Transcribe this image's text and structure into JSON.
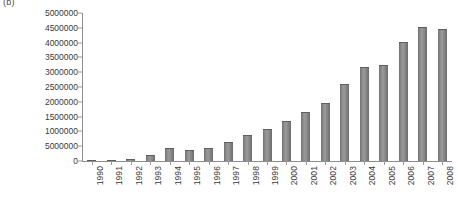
{
  "figure": {
    "panel_label": "(b)",
    "bar_color": "#7d7d7d",
    "axis_color": "#8d8d8d",
    "text_color": "#3a3a3a",
    "background": "#ffffff"
  },
  "chart_data": {
    "type": "bar",
    "title": "",
    "subtitle": "",
    "xlabel": "",
    "ylabel": "",
    "categories": [
      "1990",
      "1991",
      "1992",
      "1993",
      "1994",
      "1995",
      "1996",
      "1997",
      "1998",
      "1999",
      "2000",
      "2001",
      "2002",
      "2003",
      "2004",
      "2005",
      "2006",
      "2007",
      "2008"
    ],
    "values": [
      30000,
      40000,
      60000,
      200000,
      450000,
      380000,
      430000,
      650000,
      870000,
      1070000,
      1350000,
      1650000,
      1950000,
      2600000,
      3180000,
      3250000,
      4030000,
      4520000,
      4460000
    ],
    "series": [
      {
        "name": "",
        "values": [
          30000,
          40000,
          60000,
          200000,
          450000,
          380000,
          430000,
          650000,
          870000,
          1070000,
          1350000,
          1650000,
          1950000,
          2600000,
          3180000,
          3250000,
          4030000,
          4520000,
          4460000
        ]
      }
    ],
    "ylim": [
      0,
      5000000
    ],
    "ytick_values": [
      5000000,
      4500000,
      4000000,
      3500000,
      3000000,
      2500000,
      2000000,
      1500000,
      1000000,
      500000,
      0
    ],
    "ytick_labels": [
      "5000000",
      "4500000",
      "4000000",
      "3500000",
      "3000000",
      "2500000",
      "2000000",
      "1500000",
      "1000000",
      "5000000",
      "0"
    ],
    "grid": false,
    "legend": null,
    "legend_position": "none",
    "xtick_rotation": -90,
    "annotations": []
  }
}
